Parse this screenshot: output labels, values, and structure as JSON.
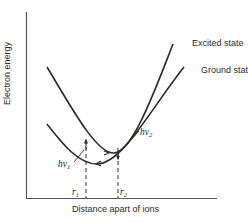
{
  "figure": {
    "y_axis_label": "Electron energy",
    "x_axis_label": "Distance apart of ions",
    "curves": [
      {
        "name": "Excited state",
        "label": "Excited state"
      },
      {
        "name": "Ground state",
        "label": "Ground state"
      }
    ],
    "transitions": [
      {
        "symbol": "hν",
        "subscript": "1",
        "direction": "up",
        "position": "r1"
      },
      {
        "symbol": "hν",
        "subscript": "2",
        "direction": "down",
        "position": "r2"
      }
    ],
    "markers": [
      {
        "symbol": "r",
        "subscript": "1"
      },
      {
        "symbol": "r",
        "subscript": "2"
      }
    ],
    "colors": {
      "line": "#2a2a2a",
      "background": "#ffffff"
    }
  }
}
